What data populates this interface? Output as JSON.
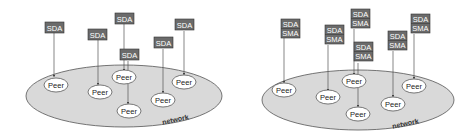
{
  "colors": {
    "background": "#ffffff",
    "network_fill": "#d9d9d9",
    "network_stroke": "#555555",
    "box_fill": "#6b6b6b",
    "box_text": "#ffffff",
    "peer_fill": "#ffffff",
    "peer_stroke": "#444444",
    "line": "#555555"
  },
  "left_diagram": {
    "network_label": "network",
    "agents": [
      {
        "top": "SDA"
      },
      {
        "top": "SDA"
      },
      {
        "top": "SDA"
      },
      {
        "top": "SDA"
      },
      {
        "top": "SDA"
      },
      {
        "top": "SDA"
      }
    ],
    "peers": [
      "Peer",
      "Peer",
      "Peer",
      "Peer",
      "Peer",
      "Peer"
    ]
  },
  "right_diagram": {
    "network_label": "network",
    "agents": [
      {
        "top": "SDA",
        "bottom": "SMA"
      },
      {
        "top": "SDA",
        "bottom": "SMA"
      },
      {
        "top": "SDA",
        "bottom": "SMA"
      },
      {
        "top": "SDA",
        "bottom": "SMA"
      },
      {
        "top": "SDA",
        "bottom": "SMA"
      },
      {
        "top": "SDA",
        "bottom": "SMA"
      }
    ],
    "peers": [
      "Peer",
      "Peer",
      "Peer",
      "Peer",
      "Peer",
      "Peer"
    ]
  }
}
